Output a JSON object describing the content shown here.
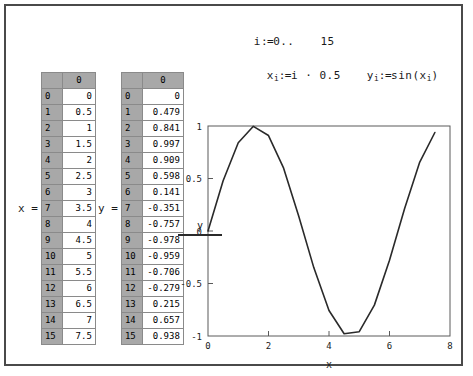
{
  "document": {
    "range_definition": {
      "variable": "i",
      "assign": ":=",
      "start": "0",
      "ellipsis": "..",
      "end": "15"
    },
    "formulas": [
      {
        "lhs_base": "x",
        "lhs_sub": "i",
        "assign": ":=",
        "rhs": "i · 0.5"
      },
      {
        "lhs_base": "y",
        "lhs_sub": "i",
        "assign": ":=",
        "rhs_pre": "sin(x",
        "rhs_sub": "i",
        "rhs_post": ")"
      }
    ],
    "matrices": [
      {
        "name": "matrix-x",
        "label": "x =",
        "column_header": "0",
        "indices": [
          "0",
          "1",
          "2",
          "3",
          "4",
          "5",
          "6",
          "7",
          "8",
          "9",
          "10",
          "11",
          "12",
          "13",
          "14",
          "15"
        ],
        "values": [
          "0",
          "0.5",
          "1",
          "1.5",
          "2",
          "2.5",
          "3",
          "3.5",
          "4",
          "4.5",
          "5",
          "5.5",
          "6",
          "6.5",
          "7",
          "7.5"
        ]
      },
      {
        "name": "matrix-y",
        "label": "y =",
        "column_header": "0",
        "indices": [
          "0",
          "1",
          "2",
          "3",
          "4",
          "5",
          "6",
          "7",
          "8",
          "9",
          "10",
          "11",
          "12",
          "13",
          "14",
          "15"
        ],
        "values": [
          "0",
          "0.479",
          "0.841",
          "0.997",
          "0.909",
          "0.598",
          "0.141",
          "-0.351",
          "-0.757",
          "-0.978",
          "-0.959",
          "-0.706",
          "-0.279",
          "0.215",
          "0.657",
          "0.938"
        ]
      }
    ],
    "legend": {
      "series_label": "y",
      "line_color": "#2a2a2a"
    }
  },
  "chart_data": {
    "type": "line",
    "title": "",
    "xlabel": "x",
    "ylabel": "y",
    "xlim": [
      0,
      8
    ],
    "ylim": [
      -1,
      1
    ],
    "xticks": [
      0,
      2,
      4,
      6,
      8
    ],
    "xticklabels": [
      "0",
      "2",
      "4",
      "6",
      "8"
    ],
    "yticks": [
      -1,
      -0.5,
      0,
      0.5,
      1
    ],
    "yticklabels": [
      "-1",
      "-0.5",
      "0",
      "0.5",
      "1"
    ],
    "grid": false,
    "legend_position": "left-outside",
    "line_color": "#2a2a2a",
    "series": [
      {
        "name": "y",
        "x": [
          0,
          0.5,
          1,
          1.5,
          2,
          2.5,
          3,
          3.5,
          4,
          4.5,
          5,
          5.5,
          6,
          6.5,
          7,
          7.5
        ],
        "values": [
          0,
          0.479,
          0.841,
          0.997,
          0.909,
          0.598,
          0.141,
          -0.351,
          -0.757,
          -0.978,
          -0.959,
          -0.706,
          -0.279,
          0.215,
          0.657,
          0.938
        ]
      }
    ]
  }
}
